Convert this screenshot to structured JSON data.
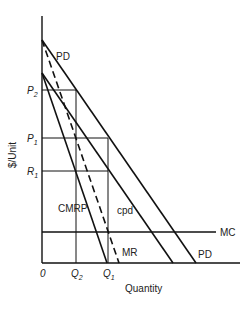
{
  "diagram": {
    "y_axis_label": "$/Unit",
    "x_axis_label": "Quantity",
    "origin_label": "0",
    "y_ticks": [
      {
        "label": "P",
        "sub": "2",
        "y": 90
      },
      {
        "label": "P",
        "sub": "1",
        "y": 138
      },
      {
        "label": "R",
        "sub": "1",
        "y": 171
      }
    ],
    "x_ticks": [
      {
        "label": "Q",
        "sub": "2",
        "x": 76
      },
      {
        "label": "Q",
        "sub": "1",
        "x": 108
      }
    ],
    "curves": [
      {
        "name": "PD",
        "label": "PD",
        "style": "solid"
      },
      {
        "name": "PD-lower",
        "label": "PD",
        "style": "solid"
      },
      {
        "name": "cpd",
        "label": "cpd",
        "style": "solid"
      },
      {
        "name": "CMRP",
        "label": "CMRP",
        "style": "solid"
      },
      {
        "name": "MR",
        "label": "MR",
        "style": "dashed"
      },
      {
        "name": "MC",
        "label": "MC",
        "style": "solid"
      }
    ]
  }
}
